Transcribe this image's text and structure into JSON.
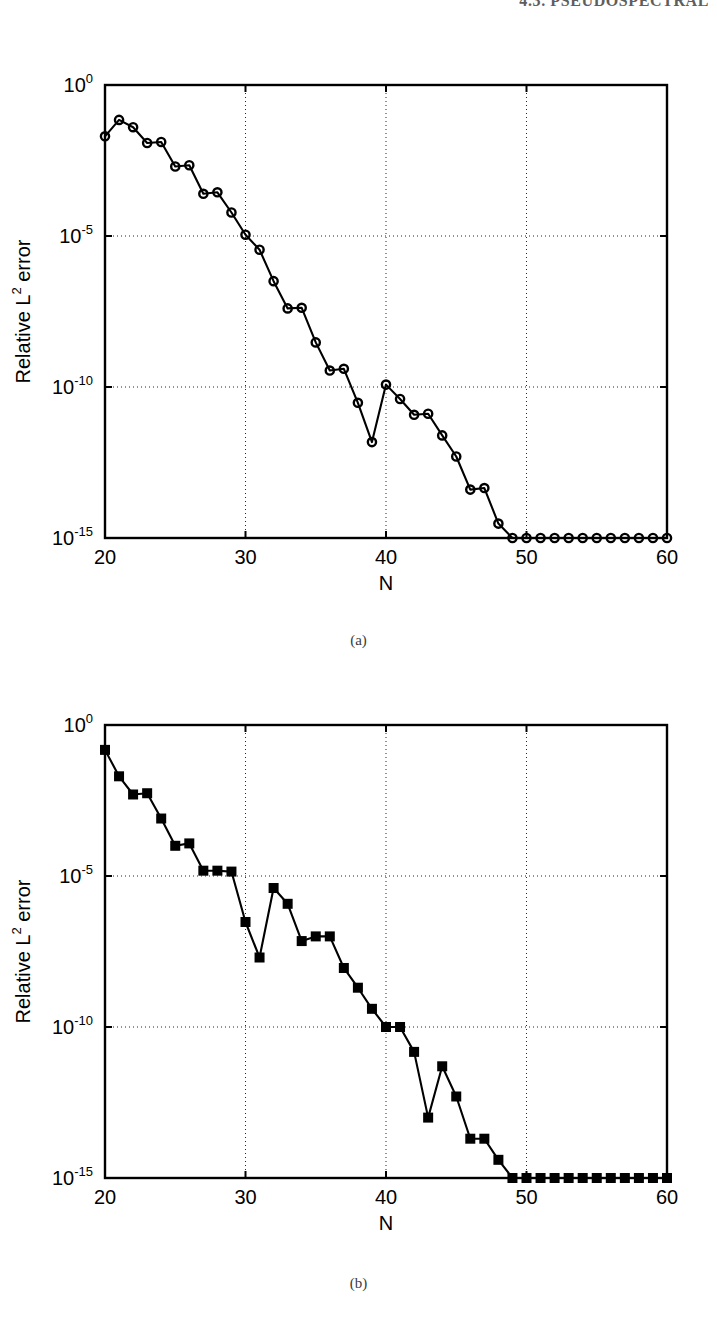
{
  "header": {
    "running_head": "4.3.  PSEUDOSPECTRAL"
  },
  "figures": [
    {
      "id": "a",
      "caption": "(a)",
      "xlabel": "N",
      "ylabel_main": "Relative L",
      "ylabel_sup": "2",
      "ylabel_tail": " error",
      "xticks": [
        "20",
        "30",
        "40",
        "50",
        "60"
      ],
      "yticks": [
        {
          "base": "10",
          "exp": "0"
        },
        {
          "base": "10",
          "exp": "-5"
        },
        {
          "base": "10",
          "exp": "-10"
        },
        {
          "base": "10",
          "exp": "-15"
        }
      ]
    },
    {
      "id": "b",
      "caption": "(b)",
      "xlabel": "N",
      "ylabel_main": "Relative L",
      "ylabel_sup": "2",
      "ylabel_tail": " error",
      "xticks": [
        "20",
        "30",
        "40",
        "50",
        "60"
      ],
      "yticks": [
        {
          "base": "10",
          "exp": "0"
        },
        {
          "base": "10",
          "exp": "-5"
        },
        {
          "base": "10",
          "exp": "-10"
        },
        {
          "base": "10",
          "exp": "-15"
        }
      ]
    }
  ],
  "chart_data": [
    {
      "type": "line",
      "panel": "(a)",
      "title": "",
      "xlabel": "N",
      "ylabel": "Relative L^2 error",
      "xlim": [
        20,
        60
      ],
      "ylim": [
        1e-15,
        1.0
      ],
      "yscale": "log",
      "grid": true,
      "grid_style": "dotted",
      "marker": "circle-open",
      "line_color": "#000000",
      "x": [
        20,
        21,
        22,
        23,
        24,
        25,
        26,
        27,
        28,
        29,
        30,
        31,
        32,
        33,
        34,
        35,
        36,
        37,
        38,
        39,
        40,
        41,
        42,
        43,
        44,
        45,
        46,
        47,
        48,
        49,
        50,
        51,
        52,
        53,
        54,
        55,
        56,
        57,
        58,
        59,
        60
      ],
      "y": [
        0.02,
        0.07,
        0.04,
        0.012,
        0.013,
        0.002,
        0.0022,
        0.00025,
        0.00028,
        6e-05,
        1.1e-05,
        3.5e-06,
        3.2e-07,
        4e-08,
        4.2e-08,
        3e-09,
        3.5e-10,
        4e-10,
        3e-11,
        1.5e-12,
        1.2e-10,
        4e-11,
        1.2e-11,
        1.3e-11,
        2.5e-12,
        5e-13,
        4e-14,
        4.5e-14,
        3e-15,
        1e-16,
        1.1e-16,
        3e-17,
        6e-18,
        2.5e-17,
        8e-17,
        1.4e-16,
        4e-17,
        1.6e-16,
        1.7e-16,
        1.3e-16,
        1.1e-16
      ]
    },
    {
      "type": "line",
      "panel": "(b)",
      "title": "",
      "xlabel": "N",
      "ylabel": "Relative L^2 error",
      "xlim": [
        20,
        60
      ],
      "ylim": [
        1e-15,
        1.0
      ],
      "yscale": "log",
      "grid": true,
      "grid_style": "dotted",
      "marker": "square-filled",
      "line_color": "#000000",
      "x": [
        20,
        21,
        22,
        23,
        24,
        25,
        26,
        27,
        28,
        29,
        30,
        31,
        32,
        33,
        34,
        35,
        36,
        37,
        38,
        39,
        40,
        41,
        42,
        43,
        44,
        45,
        46,
        47,
        48,
        49,
        50,
        51,
        52,
        53,
        54,
        55,
        56,
        57,
        58,
        59,
        60
      ],
      "y": [
        0.15,
        0.02,
        0.005,
        0.0055,
        0.0008,
        0.0001,
        0.00012,
        1.5e-05,
        1.5e-05,
        1.4e-05,
        3e-07,
        2e-08,
        4e-06,
        1.2e-06,
        7e-08,
        1e-07,
        1e-07,
        9e-09,
        2e-09,
        4e-10,
        1e-10,
        1e-10,
        1.5e-11,
        1e-13,
        5e-12,
        5e-13,
        2e-14,
        2e-14,
        4e-15,
        1e-16,
        1.1e-16,
        1.5e-16,
        9e-17,
        8e-17,
        4.5e-17,
        4e-17,
        1e-16,
        5e-17,
        8e-18,
        7e-16,
        3e-16
      ]
    }
  ]
}
